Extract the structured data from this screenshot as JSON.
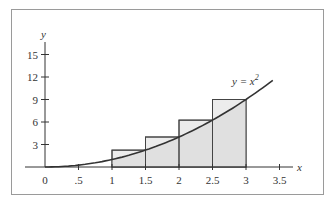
{
  "chart_data": {
    "type": "line",
    "title": "",
    "xlabel": "x",
    "ylabel": "y",
    "curve_label": "y = x²",
    "function": "y = x^2",
    "xlim": [
      0,
      3.5
    ],
    "ylim": [
      0,
      15
    ],
    "x_ticks": [
      "0",
      ".5",
      "1",
      "1.5",
      "2",
      "2.5",
      "3",
      "3.5"
    ],
    "y_ticks": [
      "3",
      "6",
      "9",
      "12",
      "15"
    ],
    "curve": {
      "x": [
        0,
        0.5,
        1,
        1.5,
        2,
        2.5,
        3,
        3.4
      ],
      "y": [
        0,
        0.25,
        1,
        2.25,
        4,
        6.25,
        9,
        11.56
      ]
    },
    "rectangles": [
      {
        "x0": 1,
        "x1": 1.5,
        "height": 2.25
      },
      {
        "x0": 1.5,
        "x1": 2,
        "height": 4
      },
      {
        "x0": 2,
        "x1": 2.5,
        "height": 6.25
      },
      {
        "x0": 2.5,
        "x1": 3,
        "height": 9
      }
    ],
    "shaded_region": {
      "under": "y = x^2",
      "from": 1,
      "to": 3
    },
    "grid": false,
    "legend": "none"
  },
  "axes": {
    "x_label": "x",
    "y_label": "y",
    "curve_label_main": "y = x",
    "curve_label_exp": "2"
  }
}
